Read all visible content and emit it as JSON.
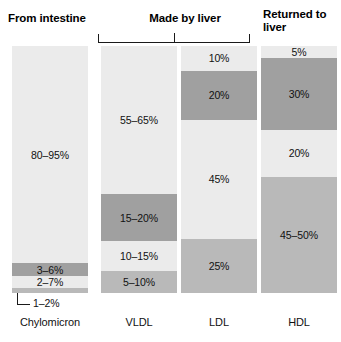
{
  "headers": {
    "from_intestine": "From intestine",
    "made_by_liver": "Made by liver",
    "returned_to_liver": "Returned to liver"
  },
  "callout": {
    "label": "1–2%"
  },
  "chart_data": {
    "type": "bar",
    "title": "",
    "subtitle": "",
    "xlabel": "",
    "ylabel": "",
    "ylim": [
      0,
      100
    ],
    "grid": false,
    "legend_position": "none",
    "orientation": "vertical-stacked",
    "categories": [
      "Chylomicron",
      "VLDL",
      "LDL",
      "HDL"
    ],
    "group_annotations": [
      {
        "label": "From intestine",
        "covers": [
          "Chylomicron"
        ],
        "bracket": false
      },
      {
        "label": "Made by liver",
        "covers": [
          "VLDL",
          "LDL"
        ],
        "bracket": true
      },
      {
        "label": "Returned to liver",
        "covers": [
          "HDL"
        ],
        "bracket": false
      }
    ],
    "columns": [
      {
        "name": "Chylomicron",
        "segments": [
          {
            "label": "80–95%",
            "value": 88,
            "tone": "light",
            "show_label": true
          },
          {
            "label": "3–6%",
            "value": 5,
            "tone": "dark",
            "show_label": true
          },
          {
            "label": "2–7%",
            "value": 5,
            "tone": "light",
            "show_label": true
          },
          {
            "label": "1–2%",
            "value": 2,
            "tone": "medium",
            "show_label": false
          }
        ]
      },
      {
        "name": "VLDL",
        "segments": [
          {
            "label": "55–65%",
            "value": 60,
            "tone": "light",
            "show_label": true
          },
          {
            "label": "15–20%",
            "value": 19,
            "tone": "dark",
            "show_label": true
          },
          {
            "label": "10–15%",
            "value": 12,
            "tone": "light",
            "show_label": true
          },
          {
            "label": "5–10%",
            "value": 9,
            "tone": "medium",
            "show_label": true
          }
        ]
      },
      {
        "name": "LDL",
        "segments": [
          {
            "label": "10%",
            "value": 10,
            "tone": "light",
            "show_label": true
          },
          {
            "label": "20%",
            "value": 20,
            "tone": "dark",
            "show_label": true
          },
          {
            "label": "45%",
            "value": 48,
            "tone": "light",
            "show_label": true
          },
          {
            "label": "25%",
            "value": 22,
            "tone": "medium",
            "show_label": true
          }
        ]
      },
      {
        "name": "HDL",
        "segments": [
          {
            "label": "5%",
            "value": 5,
            "tone": "light",
            "show_label": true
          },
          {
            "label": "30%",
            "value": 29,
            "tone": "dark",
            "show_label": true
          },
          {
            "label": "20%",
            "value": 19,
            "tone": "light",
            "show_label": true
          },
          {
            "label": "45–50%",
            "value": 47,
            "tone": "medium",
            "show_label": true
          }
        ]
      }
    ],
    "colors": {
      "light": "#ebebeb",
      "medium": "#b9b9b9",
      "dark": "#a0a0a0",
      "text": "#111111",
      "background": "#ffffff"
    }
  }
}
